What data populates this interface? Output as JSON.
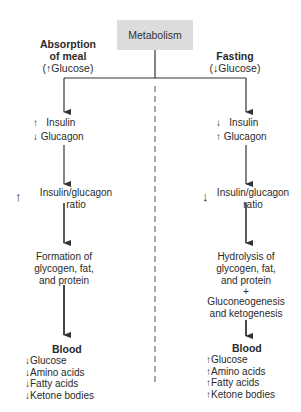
{
  "root": {
    "label": "Metabolism"
  },
  "left_branch": {
    "heading_line1": "Absorption",
    "heading_line2": "of meal",
    "heading_condition": "Glucose",
    "heading_direction": "up",
    "hormones": [
      {
        "label": "Insulin",
        "direction": "up"
      },
      {
        "label": "Glucagon",
        "direction": "down"
      }
    ],
    "ratio": {
      "line1": "Insulin/glucagon",
      "line2": "ratio",
      "direction": "up"
    },
    "process": [
      "Formation of",
      "glycogen, fat,",
      "and protein"
    ],
    "blood": {
      "title": "Blood",
      "items": [
        {
          "label": "Glucose",
          "direction": "down"
        },
        {
          "label": "Amino acids",
          "direction": "down"
        },
        {
          "label": "Fatty acids",
          "direction": "down"
        },
        {
          "label": "Ketone bodies",
          "direction": "down"
        }
      ]
    }
  },
  "right_branch": {
    "heading_line1": "Fasting",
    "heading_condition": "Glucose",
    "heading_direction": "down",
    "hormones": [
      {
        "label": "Insulin",
        "direction": "down"
      },
      {
        "label": "Glucagon",
        "direction": "up"
      }
    ],
    "ratio": {
      "line1": "Insulin/glucagon",
      "line2": "ratio",
      "direction": "down"
    },
    "process": [
      "Hydrolysis of",
      "glycogen, fat,",
      "and protein",
      "+",
      "Gluconeogenesis",
      "and ketogenesis"
    ],
    "blood": {
      "title": "Blood",
      "items": [
        {
          "label": "Glucose",
          "direction": "up"
        },
        {
          "label": "Amino acids",
          "direction": "up"
        },
        {
          "label": "Fatty acids",
          "direction": "up"
        },
        {
          "label": "Ketone bodies",
          "direction": "up"
        }
      ]
    }
  },
  "arrow_glyphs": {
    "up": "↑",
    "down": "↓"
  }
}
